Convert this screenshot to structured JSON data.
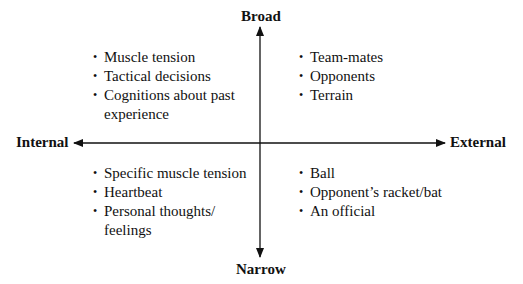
{
  "diagram": {
    "type": "quadrant",
    "axes": {
      "top": "Broad",
      "bottom": "Narrow",
      "left": "Internal",
      "right": "External"
    },
    "quadrants": {
      "top_left": {
        "items": [
          "Muscle tension",
          "Tactical decisions",
          "Cognitions about past experience"
        ]
      },
      "top_right": {
        "items": [
          "Team-mates",
          "Opponents",
          "Terrain"
        ]
      },
      "bottom_left": {
        "items": [
          "Specific muscle tension",
          "Heartbeat",
          "Personal thoughts/ feelings"
        ]
      },
      "bottom_right": {
        "items": [
          "Ball",
          "Opponent’s racket/bat",
          "An official"
        ]
      }
    },
    "bullet_glyph": "•",
    "colors": {
      "line": "#111111",
      "text": "#111111",
      "background": "#ffffff"
    }
  }
}
